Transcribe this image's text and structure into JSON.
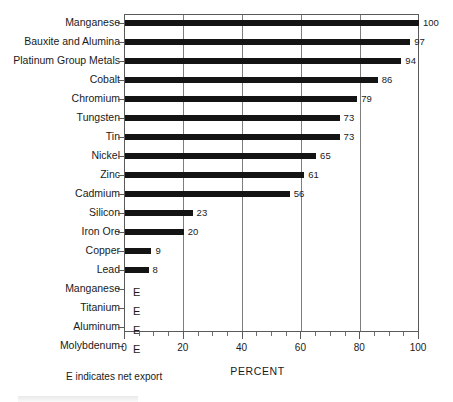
{
  "chart_data": {
    "type": "bar",
    "orientation": "horizontal",
    "title": "",
    "subtitle": "",
    "xlabel": "PERCENT",
    "ylabel": "",
    "xlim": [
      0,
      100
    ],
    "xticks": [
      0,
      20,
      40,
      60,
      80,
      100
    ],
    "xtick_labels": [
      "0",
      "20",
      "40",
      "60",
      "80",
      "100"
    ],
    "minor_tick_step": 5,
    "grid": "vertical",
    "legend": "none",
    "annotation": "E indicates net export",
    "bar_color": "#141414",
    "categories": [
      "Manganese",
      "Bauxite and Alumina",
      "Platinum Group Metals",
      "Cobalt",
      "Chromium",
      "Tungsten",
      "Tin",
      "Nickel",
      "Zinc",
      "Cadmium",
      "Silicon",
      "Iron Ore",
      "Copper",
      "Lead",
      "Manganese",
      "Titanium",
      "Aluminum",
      "Molybdenum"
    ],
    "values": [
      100,
      97,
      94,
      86,
      79,
      73,
      73,
      65,
      61,
      56,
      23,
      20,
      9,
      8,
      null,
      null,
      null,
      null
    ],
    "value_labels": [
      "100",
      "97",
      "94",
      "86",
      "79",
      "73",
      "73",
      "65",
      "61",
      "56",
      "23",
      "20",
      "9",
      "8",
      "E",
      "E",
      "E",
      "E"
    ],
    "export_flag": [
      false,
      false,
      false,
      false,
      false,
      false,
      false,
      false,
      false,
      false,
      false,
      false,
      false,
      false,
      true,
      true,
      true,
      true
    ]
  },
  "footnote": {
    "text": "E indicates net export"
  },
  "axis": {
    "x_title": "PERCENT"
  }
}
